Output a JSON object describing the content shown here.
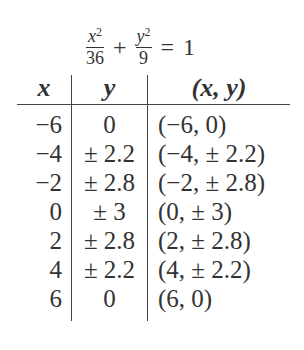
{
  "equation": {
    "term1": {
      "numerator_var": "x",
      "numerator_exp": "2",
      "denominator": "36"
    },
    "plus": "+",
    "term2": {
      "numerator_var": "y",
      "numerator_exp": "2",
      "denominator": "9"
    },
    "equals": "=",
    "rhs": "1"
  },
  "table": {
    "headers": [
      "x",
      "y",
      "(x, y)"
    ],
    "rows": [
      {
        "x": "−6",
        "y": "0",
        "point": "(−6, 0)"
      },
      {
        "x": "−4",
        "y": "± 2.2",
        "point": "(−4, ± 2.2)"
      },
      {
        "x": "−2",
        "y": "± 2.8",
        "point": "(−2, ± 2.8)"
      },
      {
        "x": "0",
        "y": "± 3",
        "point": "(0, ± 3)"
      },
      {
        "x": "2",
        "y": "± 2.8",
        "point": "(2, ± 2.8)"
      },
      {
        "x": "4",
        "y": "± 2.2",
        "point": "(4, ± 2.2)"
      },
      {
        "x": "6",
        "y": "0",
        "point": "(6, 0)"
      }
    ]
  }
}
